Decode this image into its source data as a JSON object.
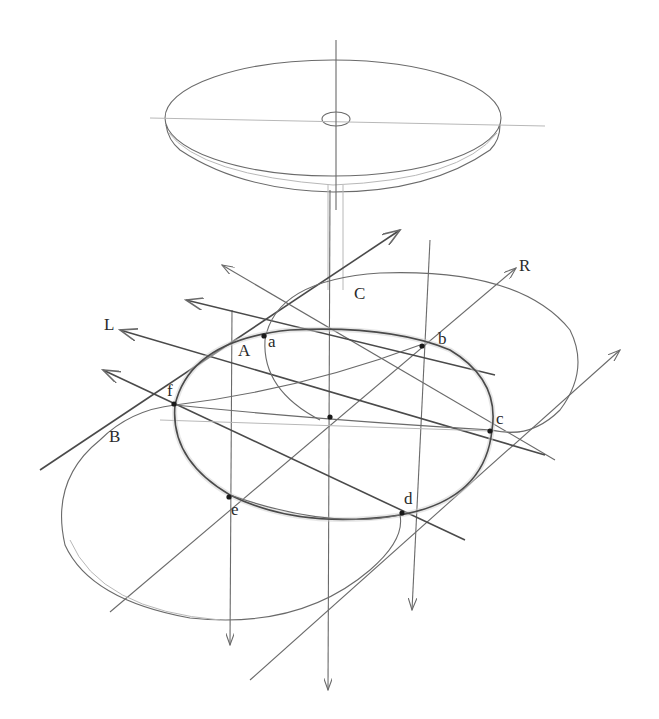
{
  "figure": {
    "labels": {
      "L": "L",
      "R": "R",
      "A": "A",
      "B": "B",
      "C": "C",
      "a": "a",
      "b": "b",
      "c": "c",
      "d": "d",
      "e": "e",
      "f": "f"
    },
    "colors": {
      "background": "#ffffff",
      "pencil": "#6a6a6a",
      "pencil_dark": "#4a4a4a",
      "pencil_light": "#b8b8b8"
    }
  }
}
